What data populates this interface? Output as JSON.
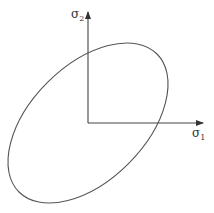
{
  "diagram": {
    "type": "yield-surface-ellipse",
    "axes": {
      "x_label": "σ",
      "x_subscript": "1",
      "y_label": "σ",
      "y_subscript": "2"
    },
    "ellipse": {
      "center": [
        88,
        123
      ],
      "rx": 97.6,
      "ry": 57.3,
      "rotation_deg": -45
    },
    "colors": {
      "stroke": "#555555",
      "background": "#ffffff"
    }
  }
}
